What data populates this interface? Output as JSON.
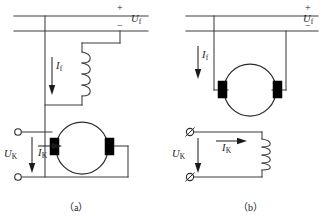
{
  "figure": {
    "panels": [
      {
        "id": "a",
        "caption": "（a）",
        "supply": {
          "plus_sign": "+",
          "minus_sign": "−",
          "voltage_label": "U",
          "voltage_subscript": "f"
        },
        "field": {
          "current_label": "I",
          "current_subscript": "f",
          "current_direction": "down",
          "element": "field-winding-coil"
        },
        "armature": {
          "element": "dc-machine-circle",
          "brushes": 2,
          "terminal_count": 2,
          "terminal_style": "open-circle",
          "voltage_label": "U",
          "voltage_subscript": "K",
          "voltage_direction": "down",
          "current_label": "I",
          "current_subscript": "K",
          "current_direction": "right"
        }
      },
      {
        "id": "b",
        "caption": "（b）",
        "supply": {
          "plus_sign": "+",
          "minus_sign": "−",
          "voltage_label": "U",
          "voltage_subscript": "f"
        },
        "field": {
          "current_label": "I",
          "current_subscript": "f",
          "current_direction": "down",
          "element": "straight-lead"
        },
        "armature": {
          "element": "dc-machine-circle",
          "brushes": 2,
          "terminal_count": 2,
          "terminal_style": "slashed-circle",
          "voltage_label": "U",
          "voltage_subscript": "K",
          "voltage_direction": "down",
          "current_label": "I",
          "current_subscript": "K",
          "current_direction": "right",
          "series_element": "starting-coil"
        }
      }
    ]
  }
}
